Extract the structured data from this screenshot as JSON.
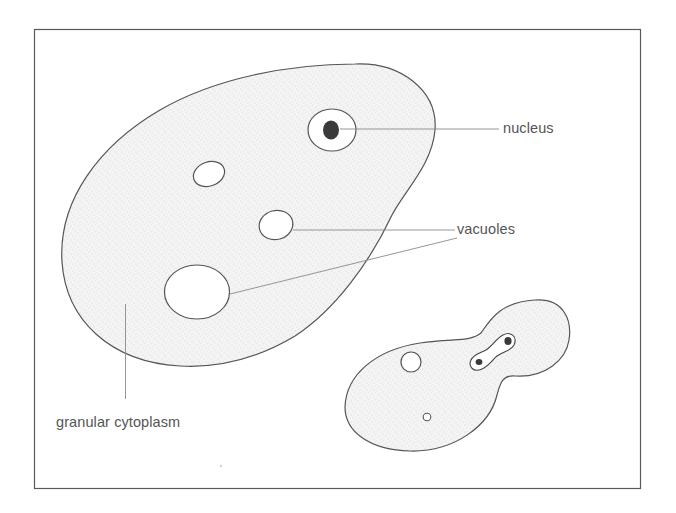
{
  "figure": {
    "type": "biological-diagram",
    "frame": {
      "x": 34,
      "y": 29,
      "width": 606,
      "height": 459,
      "stroke": "#555555"
    },
    "colors": {
      "outline": "#555555",
      "cytoplasm_fill": "#f3f3f3",
      "stipple": "#bdbdbd",
      "nucleus_dark": "#3a3a3a",
      "leader_line": "#8a8a8a",
      "label_text": "#555555"
    }
  },
  "labels": {
    "nucleus": "nucleus",
    "vacuoles": "vacuoles",
    "granular_cytoplasm": "granular cytoplasm"
  },
  "cells": [
    {
      "name": "large-cell",
      "parts": [
        "nucleus",
        "vacuole",
        "vacuole",
        "vacuole",
        "granular cytoplasm"
      ]
    },
    {
      "name": "budding-cell",
      "parts": [
        "dividing nucleus",
        "vacuole",
        "vacuole",
        "bud"
      ]
    }
  ]
}
